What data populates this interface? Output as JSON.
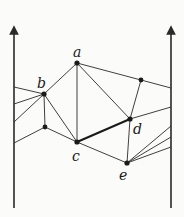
{
  "diagram": {
    "colors": {
      "line": "#2a2a2a",
      "background": "#fbfbf9"
    },
    "walls": [
      {
        "id": "left-wall",
        "x": 14,
        "y1": 208,
        "y2": 27
      },
      {
        "id": "right-wall",
        "x": 171,
        "y1": 208,
        "y2": 27
      }
    ],
    "nodes": [
      {
        "id": "a",
        "label": "a",
        "x": 77,
        "y": 63,
        "lx": 73,
        "ly": 56
      },
      {
        "id": "b",
        "label": "b",
        "x": 44,
        "y": 94,
        "lx": 37,
        "ly": 87
      },
      {
        "id": "c",
        "label": "c",
        "x": 77,
        "y": 142,
        "lx": 72,
        "ly": 161
      },
      {
        "id": "d",
        "label": "d",
        "x": 130,
        "y": 119,
        "lx": 133,
        "ly": 133
      },
      {
        "id": "e",
        "label": "e",
        "x": 127,
        "y": 163,
        "lx": 119,
        "ly": 180
      },
      {
        "id": "p1",
        "label": "",
        "x": 141,
        "y": 80
      },
      {
        "id": "p2",
        "label": "",
        "x": 45,
        "y": 127
      }
    ]
  }
}
